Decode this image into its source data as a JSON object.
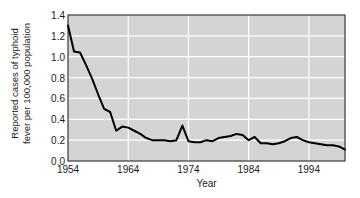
{
  "chart_data": {
    "type": "line",
    "title": "",
    "xlabel": "Year",
    "ylabel": "Reported cases of typhoid fever per 100,000 population",
    "ylabel_line1": "Reported cases of typhoid",
    "ylabel_line2": "fever per 100,000 population",
    "xlim": [
      1954,
      2000
    ],
    "ylim": [
      0.0,
      1.4
    ],
    "yticks": [
      "0.0",
      "0.2",
      "0.4",
      "0.6",
      "0.8",
      "1.0",
      "1.2",
      "1.4"
    ],
    "ytick_values": [
      0.0,
      0.2,
      0.4,
      0.6,
      0.8,
      1.0,
      1.2,
      1.4
    ],
    "xticks": [
      "1954",
      "1964",
      "1974",
      "1984",
      "1994"
    ],
    "xtick_values": [
      1954,
      1964,
      1974,
      1984,
      1994
    ],
    "grid": true,
    "legend": "none",
    "line_color": "#000000",
    "plot_bg_color": "#d4d4d4",
    "grid_color": "#ffffff",
    "figure_bg_color": "#ffffff",
    "axis_color": "#3a3a3a",
    "x": [
      1954,
      1955,
      1956,
      1957,
      1958,
      1959,
      1960,
      1961,
      1962,
      1963,
      1964,
      1965,
      1966,
      1967,
      1968,
      1969,
      1970,
      1971,
      1972,
      1973,
      1974,
      1975,
      1976,
      1977,
      1978,
      1979,
      1980,
      1981,
      1982,
      1983,
      1984,
      1985,
      1986,
      1987,
      1988,
      1989,
      1990,
      1991,
      1992,
      1993,
      1994,
      1995,
      1996,
      1997,
      1998,
      1999,
      2000
    ],
    "values": [
      1.3,
      1.05,
      1.04,
      0.92,
      0.79,
      0.64,
      0.5,
      0.47,
      0.29,
      0.33,
      0.32,
      0.29,
      0.26,
      0.22,
      0.2,
      0.2,
      0.2,
      0.19,
      0.2,
      0.34,
      0.19,
      0.18,
      0.18,
      0.2,
      0.19,
      0.22,
      0.23,
      0.24,
      0.26,
      0.25,
      0.2,
      0.23,
      0.17,
      0.17,
      0.16,
      0.17,
      0.19,
      0.22,
      0.23,
      0.2,
      0.18,
      0.17,
      0.16,
      0.15,
      0.15,
      0.14,
      0.11
    ],
    "series": [
      {
        "name": "Reported typhoid fever cases per 100,000 population",
        "values": [
          1.3,
          1.05,
          1.04,
          0.92,
          0.79,
          0.64,
          0.5,
          0.47,
          0.29,
          0.33,
          0.32,
          0.29,
          0.26,
          0.22,
          0.2,
          0.2,
          0.2,
          0.19,
          0.2,
          0.34,
          0.19,
          0.18,
          0.18,
          0.2,
          0.19,
          0.22,
          0.23,
          0.24,
          0.26,
          0.25,
          0.2,
          0.23,
          0.17,
          0.17,
          0.16,
          0.17,
          0.19,
          0.22,
          0.23,
          0.2,
          0.18,
          0.17,
          0.16,
          0.15,
          0.15,
          0.14,
          0.11
        ]
      }
    ]
  }
}
